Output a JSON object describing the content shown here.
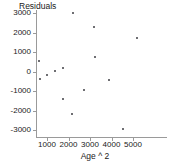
{
  "chart_data": {
    "type": "scatter",
    "title": "",
    "xlabel": "Age ^ 2",
    "ylabel": "Residuals",
    "xlim": [
      300,
      5600
    ],
    "ylim": [
      -3400,
      3350
    ],
    "xticks": [
      1000,
      2000,
      3000,
      4000,
      5000
    ],
    "xtick_labels": [
      "1000",
      "2000",
      "3000",
      "4000",
      "5000"
    ],
    "yticks": [
      3000,
      2000,
      1000,
      0,
      -1000,
      -2000,
      -3000
    ],
    "ytick_labels": [
      "3000",
      "2000",
      "1000",
      "0",
      "-1000",
      "-2000",
      "-3000"
    ],
    "grid": false,
    "legend": false,
    "marker_color": "#6e6e72",
    "axis_color": "#9a9a9a",
    "background_color": "#ffffff",
    "series": [
      {
        "name": "Residuals",
        "points": [
          {
            "x": 640,
            "y": 560
          },
          {
            "x": 680,
            "y": -400
          },
          {
            "x": 1000,
            "y": -200
          },
          {
            "x": 1380,
            "y": 50
          },
          {
            "x": 1760,
            "y": 200
          },
          {
            "x": 1750,
            "y": -1400
          },
          {
            "x": 2230,
            "y": 2980
          },
          {
            "x": 2170,
            "y": -2170
          },
          {
            "x": 2700,
            "y": -960
          },
          {
            "x": 3200,
            "y": 2270
          },
          {
            "x": 3250,
            "y": 740
          },
          {
            "x": 3870,
            "y": -460
          },
          {
            "x": 4520,
            "y": -2960
          },
          {
            "x": 5200,
            "y": 1730
          }
        ]
      }
    ]
  },
  "axes": {
    "y_title": "Residuals",
    "x_title": "Age ^ 2"
  }
}
